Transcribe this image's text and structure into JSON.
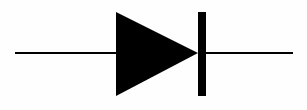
{
  "diagram": {
    "title": "Diode schematic symbol",
    "symbol": "diode",
    "colors": {
      "background": "#fefefe",
      "stroke": "#000000",
      "fill": "#000000"
    },
    "geometry": {
      "lead_left": {
        "x1": 15,
        "y1": 53,
        "x2": 116,
        "y2": 53
      },
      "anode_triangle": {
        "points": "116,12 116,96 198,53"
      },
      "cathode_bar": {
        "x": 198,
        "y": 12,
        "width": 8,
        "height": 84
      },
      "lead_right": {
        "x1": 206,
        "y1": 53,
        "x2": 293,
        "y2": 53
      }
    }
  }
}
